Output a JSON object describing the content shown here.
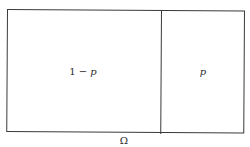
{
  "diagram": {
    "type": "partition-box",
    "regions": [
      {
        "label_const": "1 − ",
        "label_var": "p",
        "proportion": 0.64
      },
      {
        "label_const": "",
        "label_var": "p",
        "proportion": 0.36
      }
    ],
    "universe_label": "Ω",
    "stroke_color": "#3a3a3a",
    "background": "#ffffff"
  }
}
